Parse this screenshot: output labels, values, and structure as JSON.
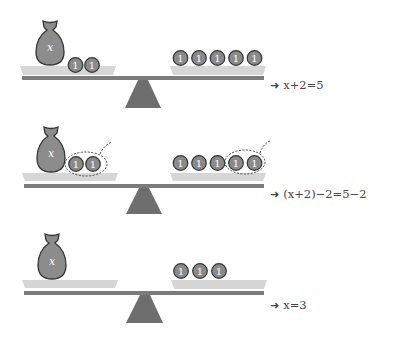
{
  "colors": {
    "bag_fill": "#8c8c8c",
    "bag_outline": "#333333",
    "coin_fill": "#8a8a8a",
    "coin_outline": "#333333",
    "coin_text": "#ffffff",
    "pan_fill": "#d6d6d6",
    "beam": "#7c7c7c",
    "fulcrum": "#6e6e6e",
    "dashed": "#444444",
    "label_text": "#444444"
  },
  "scales": [
    {
      "bag_label": "x",
      "left_coins": [
        "1",
        "1"
      ],
      "right_coins": [
        "1",
        "1",
        "1",
        "1",
        "1"
      ],
      "removal_marked": false,
      "equation": {
        "arrow": "➜",
        "text": "x+2=5"
      }
    },
    {
      "bag_label": "x",
      "left_coins": [
        "1",
        "1"
      ],
      "right_coins": [
        "1",
        "1",
        "1",
        "1",
        "1"
      ],
      "removal_marked": true,
      "equation": {
        "arrow": "➜",
        "text": "(x+2)−2=5−2"
      }
    },
    {
      "bag_label": "x",
      "left_coins": [],
      "right_coins": [
        "1",
        "1",
        "1"
      ],
      "removal_marked": false,
      "equation": {
        "arrow": "➜",
        "text": "x=3"
      }
    }
  ]
}
